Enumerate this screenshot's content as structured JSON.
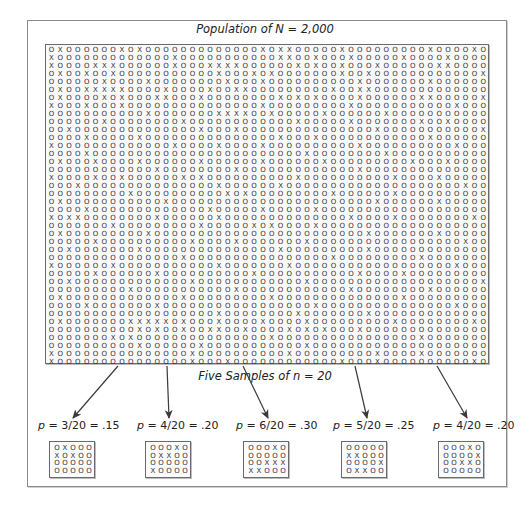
{
  "title": "Population of N = 2,000",
  "samples_label": "Five Samples of n = 20",
  "population": {
    "N": 2000,
    "columns": 50,
    "rows": [
      "OXOOOOOOXOXOOOOOOOOOOOOOXOXXOOOOOXOOOOOOOOOXOOOOXO",
      "XOOOOOOOOOOOOOXOOOOOOOOOOOXXOOXOOOXOOOOOXOOOOXOOOO",
      "XOOOOXXXOOOOOOXOOOXXXXOOOOOOXOXOOXOOOXOOOOOOXXOOOO",
      "OXOOXOOXOOOOOOOOOOOXOOOXOXOOOOOOOXOOXOOOOOOOOOOOOX",
      "OOOOOOXOOOOXOOOOOOOOXOOOXOOOOOOOOOOXOOOOOOOXOOOOOO",
      "OXOOXXXXXOOOOXOOOOXOOXXOOOOOOOOOXOOXXOOOOOOOOOOOOO",
      "OXOOOOXOXOOOXXOOOXOOOOOOOOXOXOXOOOOXOOOOOOXXOOOOOX",
      "XOOOXOOOXOOOOOOOOOOOOOOOXOOOOOOOOOXOOOOOOOOOOOXOOO",
      "OOOOOOOOOOOXOOOOOOOXXXXOOXOOOOOXOOOOOOXOOOOOOOOOOO",
      "OOOOOOXOOOOOOOOXOOOOOOOOOOOOXOOOOOXOOOOOOOXOOXOOOO",
      "OOXOOOOOOOOOOOOOOXOOOXOOOOOOOOOOOOOOOXOOOOOOOOOOOX",
      "OOOOXOOOOOXOOOOOOOOOOOOOOOXOOOXOOOOOOOOOOOOXOOOOOO",
      "XOOOOOOOOOOOOOXOOOOXOOOOXOOOOOOOOOOXOOOOOOOOOOXOOO",
      "OOOOXOOOOOOOOOOOOOOOOOOOOOOOOXOOOOOOOOXOOOOOOOOOOO",
      "OXOOOXOOOOXOOOOOOXOOOOOOXOOOOOOXOOOOOOOOOXOOOXOOOO",
      "OOOOOOOOOOOOXOOOOOOOOXOOOOOOOOOOOOOXOOOOOOOOOOOOOO",
      "XOOOOXOOXOOOOOOXOXOOOOOOOOOOXOOOOOOOOOOXOOOOXOOOOO",
      "OOOXOOOOOOOOOOOOOOOXOOOOOOXOOOOOOOOOOOOOOOOOOOOXOO",
      "OOOOOOOOOXOOOOOOOOOOXOXOOOOOOOOOXOOOOOOXOOOOOOOOOO",
      "OXOOOOOOOOOOOXOOOOOOOOOOOOOOOOOOOOOOOXOOOOOOXOOOOO",
      "OOOOXOOOOOOOOOOOOOXOOOOOXOOOOOXOOOOOOOOOOOOOOOOOOO",
      "XOXXOOOOOOOOXOOOOOOXOOOOOOOOOOOOOOXOOOOXOOOOOOOOXO",
      "OOOOOOOXOOOOOOOOOXOOOOOXOXOOOOXOOOOOOOOOOOOOOOOOOO",
      "OXOOOOOOOOOXOOOOOOOOOOOOOOOOOOOOOOOOXOOOOOOOXOOOOO",
      "OOOOOXOOOOOOOOOOXOOOOXOOOOOOOXOOOOOOOOOOOOOOOOOXOO",
      "OOXOOOOOOOXOOOOOOOOOOOOOOOXOOOOOOOOOXOOOOOOOOOOOOO",
      "OOOOOOOOOOOOOOOXOOOOOOOOOOOOOOOOXOOOOOOOOOXOOOOOOO",
      "XOOOOOOXOOOOOOOOOOOXOOOOOOOXOOOOOOOOOOOOOOOOOOXOOO",
      "OOOOOXOOOOOOXOOOOOOOOOOXOOOOOOOOOOOXOOOOXOOOOOOOOO",
      "OOXOOOOOOOOOOOOOXOOOOOOOOOOOOXOOOOOOOOOOOOOOOOOOOX",
      "OOOOOOOOOXOOOOOOOOOOOXOOOOOOOOOOOOXOOOOOOOOXOOOOOO",
      "OXOOOOOOOOOOOOOXOOOOOOOOOXOOOOOOOOOOOOOOXOOOOOOOOO",
      "OOOOXOOOOOOOXOOOOOOOOOOOOOOOOOXOOOOOOOOOOOOOOOXOOO",
      "OOOOOOOOOOOOOOOOOOOXOOOOOOOOXOOOOOOOXOOOOOOOOOOOOO",
      "OXOOOOOOOXXXXXOXOOOXOOOOXOOOOXOOOOOOOOOXOOOOOOOOXO",
      "OOOOOOOOOOXOXOOXOOXXOOXOOOOXOXOXOOOXOOOOOOOOOOOOOO",
      "OOOOOOOXOXOOOOOOOOOOOOOOOXOOOOOOOOOOOOOOOOXOOOOOOO",
      "OOOOOOOOOOXOOOOOOXOOOOOOOOOOOXOOOOOOOOOOOOOOOOOOOO",
      "XOOOOOOOOOOOOOOOXOOOOOOOOOOXOOOOOOOOOXOOOOXOOOOOOO",
      "XOOOOOOOOOOOOOOOXOOOXOOOOOOOOOOOOXOOOXOOOOOOOOOOXO"
    ]
  },
  "samples": [
    {
      "label": "p = 3/20 = .15",
      "p_var": "p",
      "rest": " = 3/20 = .15",
      "x_count": 3,
      "rows": [
        "OXOOO",
        "XOXOO",
        "OOOOO",
        "OOOOO"
      ]
    },
    {
      "label": "p = 4/20 = .20",
      "p_var": "p",
      "rest": " = 4/20 = .20",
      "x_count": 4,
      "rows": [
        "OOOXO",
        "OXXOO",
        "OOOOO",
        "XOOOO"
      ]
    },
    {
      "label": "p = 6/20 = .30",
      "p_var": "p",
      "rest": " = 6/20 = .30",
      "x_count": 6,
      "rows": [
        "OOOXO",
        "OOOOO",
        "OOXXX",
        "XXOOO"
      ]
    },
    {
      "label": "p = 5/20 = .25",
      "p_var": "p",
      "rest": " = 5/20 = .25",
      "x_count": 5,
      "rows": [
        "OOOOO",
        "XXOOO",
        "OOOOX",
        "OXXOO"
      ]
    },
    {
      "label": "p = 4/20 = .20",
      "p_var": "p",
      "rest": " = 4/20 = .20",
      "x_count": 4,
      "rows": [
        "OOOXO",
        "OOOOX",
        "OOXXO",
        "OOOOO"
      ]
    }
  ],
  "arrows": [
    {
      "x1": 118,
      "y1": 366,
      "x2": 73,
      "y2": 418
    },
    {
      "x1": 167,
      "y1": 366,
      "x2": 169,
      "y2": 418
    },
    {
      "x1": 243,
      "y1": 366,
      "x2": 268,
      "y2": 418
    },
    {
      "x1": 355,
      "y1": 366,
      "x2": 367,
      "y2": 418
    },
    {
      "x1": 437,
      "y1": 366,
      "x2": 467,
      "y2": 418
    }
  ],
  "colors": {
    "ink": "#2a2a2a",
    "border": "#6a6a6a",
    "arrow": "#3a3a3a"
  }
}
